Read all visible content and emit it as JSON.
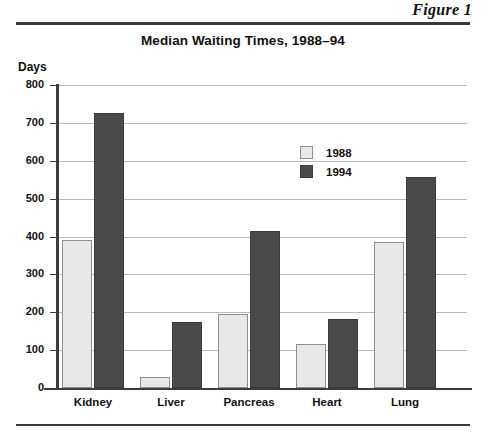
{
  "figure": {
    "label": "Figure 1"
  },
  "chart_data": {
    "type": "bar",
    "title": "Median Waiting Times, 1988–94",
    "xlabel": "",
    "ylabel": "Days",
    "ylim": [
      0,
      800
    ],
    "ytick_labels": [
      "800",
      "700",
      "600",
      "500",
      "400",
      "300",
      "200",
      "100",
      "0"
    ],
    "ytick_values": [
      800,
      700,
      600,
      500,
      400,
      300,
      200,
      100,
      0
    ],
    "grid": true,
    "legend_position": "inside-upper-right",
    "categories": [
      "Kidney",
      "Liver",
      "Pancreas",
      "Heart",
      "Lung"
    ],
    "series": [
      {
        "name": "1988",
        "color": "#e8e8e8",
        "values": [
          390,
          30,
          195,
          115,
          385
        ]
      },
      {
        "name": "1994",
        "color": "#4a4a4a",
        "values": [
          725,
          175,
          415,
          183,
          558
        ]
      }
    ]
  }
}
